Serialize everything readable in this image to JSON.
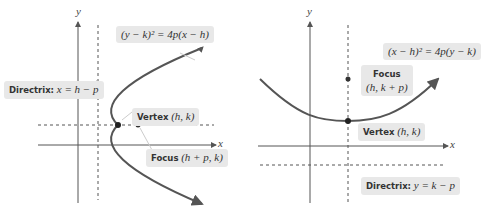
{
  "left_diagram": {
    "axis_x_label": "x",
    "axis_y_label": "y",
    "equation": "(y − k)² = 4p(x − h)",
    "directrix_label": "Directrix:",
    "directrix_eq": "x = h − p",
    "vertex_label": "Vertex",
    "vertex_coords": "(h, k)",
    "focus_label": "Focus",
    "focus_coords": "(h + p, k)"
  },
  "right_diagram": {
    "axis_x_label": "x",
    "axis_y_label": "y",
    "equation": "(x − h)² = 4p(y − k)",
    "directrix_label": "Directrix:",
    "directrix_eq": "y = k − p",
    "vertex_label": "Vertex",
    "vertex_coords": "(h, k)",
    "focus_label": "Focus",
    "focus_coords": "(h, k + p)"
  },
  "colors": {
    "curve": "#555555",
    "label_bg": "#e8e8e8",
    "axis": "#555555"
  }
}
